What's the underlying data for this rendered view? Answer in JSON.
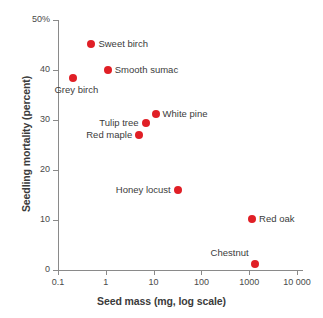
{
  "chart_data": {
    "type": "scatter",
    "title": "",
    "xlabel": "Seed mass (mg, log scale)",
    "ylabel": "Seedling mortality (percent)",
    "x_scale": "log",
    "xlim": [
      0.1,
      10000
    ],
    "ylim": [
      0,
      50
    ],
    "grid": false,
    "legend": "none",
    "marker_color": "#e01f26",
    "x_ticks": [
      {
        "value": 0.1,
        "label": "0.1"
      },
      {
        "value": 1,
        "label": "1"
      },
      {
        "value": 10,
        "label": "10"
      },
      {
        "value": 100,
        "label": "100"
      },
      {
        "value": 1000,
        "label": "1000"
      },
      {
        "value": 10000,
        "label": "10 000"
      }
    ],
    "y_ticks": [
      {
        "value": 50,
        "label": "50%"
      },
      {
        "value": 40,
        "label": "40"
      },
      {
        "value": 30,
        "label": "30"
      },
      {
        "value": 20,
        "label": "20"
      },
      {
        "value": 10,
        "label": "10"
      },
      {
        "value": 0,
        "label": "0"
      }
    ],
    "points": [
      {
        "label": "Sweet birch",
        "x": 0.5,
        "y": 45.3,
        "label_pos": "right"
      },
      {
        "label": "Smooth sumac",
        "x": 1.1,
        "y": 40.0,
        "label_pos": "right"
      },
      {
        "label": "Grey birch",
        "x": 0.21,
        "y": 38.4,
        "label_pos": "below"
      },
      {
        "label": "White pine",
        "x": 11,
        "y": 31.2,
        "label_pos": "right"
      },
      {
        "label": "Tulip tree",
        "x": 6.8,
        "y": 29.5,
        "label_pos": "left"
      },
      {
        "label": "Red maple",
        "x": 5.0,
        "y": 27.0,
        "label_pos": "left"
      },
      {
        "label": "Honey locust",
        "x": 32,
        "y": 16.1,
        "label_pos": "left"
      },
      {
        "label": "Red oak",
        "x": 1150,
        "y": 10.2,
        "label_pos": "right"
      },
      {
        "label": "Chestnut",
        "x": 1300,
        "y": 1.3,
        "label_pos": "upleft"
      }
    ]
  }
}
